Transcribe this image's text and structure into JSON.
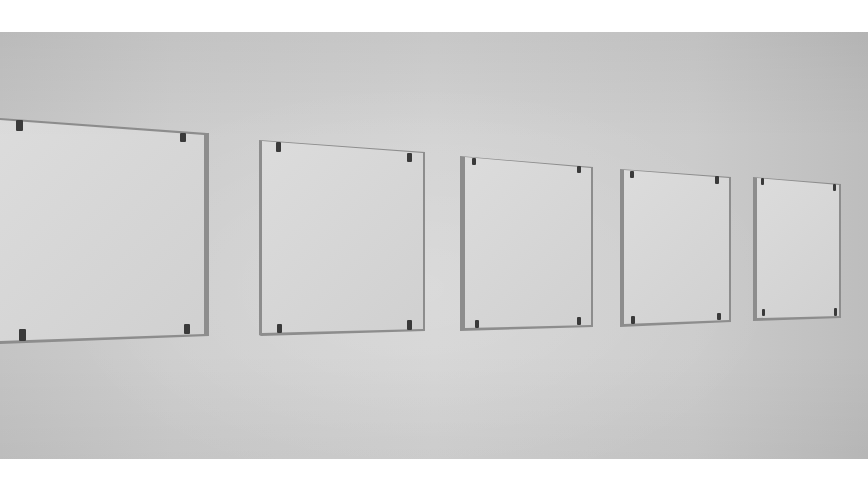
{
  "scene": {
    "description": "Five white square panels of decreasing size mounted in a row on a gallery wall, each held by four dark corner clips",
    "wall_color": "#cfcfcf",
    "panel_color": "#d8d8d8",
    "clip_color": "#3a3a3a",
    "panel_count": 5
  },
  "panels": [
    {
      "id": 1,
      "x": 0,
      "y": 118,
      "w": 207,
      "h": 225,
      "top_skew": 15,
      "bottom_skew": -7,
      "clips": 4
    },
    {
      "id": 2,
      "x": 259,
      "y": 140,
      "w": 165,
      "h": 195,
      "top_skew": 12,
      "bottom_skew": -4,
      "clips": 4
    },
    {
      "id": 3,
      "x": 460,
      "y": 156,
      "w": 132,
      "h": 174,
      "top_skew": 11,
      "bottom_skew": -3,
      "clips": 4
    },
    {
      "id": 4,
      "x": 620,
      "y": 169,
      "w": 110,
      "h": 157,
      "top_skew": 8,
      "bottom_skew": -4,
      "clips": 4
    },
    {
      "id": 5,
      "x": 753,
      "y": 177,
      "w": 87,
      "h": 143,
      "top_skew": 7,
      "bottom_skew": -2,
      "clips": 4
    }
  ]
}
